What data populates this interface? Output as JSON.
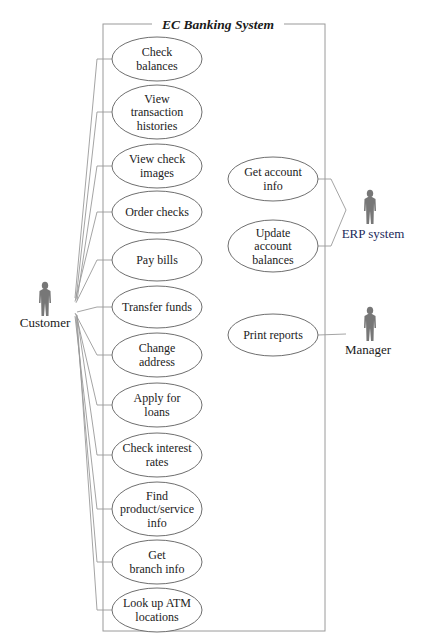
{
  "system": {
    "title": "EC Banking System",
    "frame": {
      "x": 103,
      "y": 24,
      "width": 222,
      "height": 607
    }
  },
  "actors": [
    {
      "id": "customer",
      "label": "Customer",
      "x": 45,
      "y": 282,
      "label_x": 45,
      "label_y": 327
    },
    {
      "id": "erp",
      "label": "ERP system",
      "x": 370,
      "y": 190,
      "label_x": 373,
      "label_y": 238
    },
    {
      "id": "manager",
      "label": "Manager",
      "x": 370,
      "y": 307,
      "label_x": 368,
      "label_y": 354
    }
  ],
  "customer_use_cases": [
    {
      "lines": [
        "Check",
        "balances"
      ],
      "cx": 157,
      "cy": 59,
      "rx": 45,
      "ry": 22
    },
    {
      "lines": [
        "View",
        "transaction",
        "histories"
      ],
      "cx": 157,
      "cy": 112,
      "rx": 45,
      "ry": 27
    },
    {
      "lines": [
        "View check",
        "images"
      ],
      "cx": 157,
      "cy": 166,
      "rx": 45,
      "ry": 22
    },
    {
      "lines": [
        "Order checks"
      ],
      "cx": 157,
      "cy": 212,
      "rx": 45,
      "ry": 21
    },
    {
      "lines": [
        "Pay bills"
      ],
      "cx": 157,
      "cy": 260,
      "rx": 45,
      "ry": 21
    },
    {
      "lines": [
        "Transfer funds"
      ],
      "cx": 157,
      "cy": 307,
      "rx": 45,
      "ry": 21
    },
    {
      "lines": [
        "Change",
        "address"
      ],
      "cx": 157,
      "cy": 355,
      "rx": 45,
      "ry": 22
    },
    {
      "lines": [
        "Apply for",
        "loans"
      ],
      "cx": 157,
      "cy": 405,
      "rx": 45,
      "ry": 22
    },
    {
      "lines": [
        "Check interest",
        "rates"
      ],
      "cx": 157,
      "cy": 455,
      "rx": 45,
      "ry": 22
    },
    {
      "lines": [
        "Find",
        "product/service",
        "info"
      ],
      "cx": 157,
      "cy": 509,
      "rx": 45,
      "ry": 27
    },
    {
      "lines": [
        "Get",
        "branch info"
      ],
      "cx": 157,
      "cy": 562,
      "rx": 45,
      "ry": 22
    },
    {
      "lines": [
        "Look up ATM",
        "locations"
      ],
      "cx": 157,
      "cy": 610,
      "rx": 45,
      "ry": 22
    }
  ],
  "erp_use_cases": [
    {
      "lines": [
        "Get account",
        "info"
      ],
      "cx": 273,
      "cy": 179,
      "rx": 45,
      "ry": 22
    },
    {
      "lines": [
        "Update",
        "account",
        "balances"
      ],
      "cx": 273,
      "cy": 246,
      "rx": 45,
      "ry": 26
    }
  ],
  "manager_use_cases": [
    {
      "lines": [
        "Print reports"
      ],
      "cx": 273,
      "cy": 335,
      "rx": 45,
      "ry": 21
    }
  ],
  "colors": {
    "frame": "#9a9a9a",
    "ellipse_stroke": "#6f6f6f",
    "actor_fill": "#777777",
    "text": "#222222"
  }
}
